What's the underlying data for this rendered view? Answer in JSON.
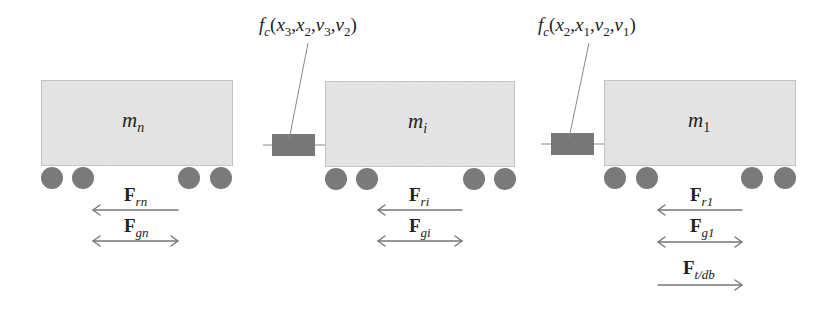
{
  "diagram": {
    "colors": {
      "car_fill": "#e2e2e2",
      "car_stroke": "#a8a8a8",
      "wheel_fill": "#7a7a7a",
      "coupler_fill": "#777777",
      "arrow_color": "#777777",
      "text_color": "#222222"
    },
    "cars": [
      {
        "id": "car-n",
        "mass_symbol": "m",
        "mass_sub": "n"
      },
      {
        "id": "car-i",
        "mass_symbol": "m",
        "mass_sub": "i"
      },
      {
        "id": "car-1",
        "mass_symbol": "m",
        "mass_sub": "1"
      }
    ],
    "couplers": [
      {
        "id": "coupler-3-2",
        "label_fn": "f",
        "label_fn_sub": "c",
        "args": "(x",
        "a1": "3",
        "a2": "2",
        "v1": "3",
        "v2": "2",
        "text": "f_c(x_3,x_2,v_3,v_2)"
      },
      {
        "id": "coupler-2-1",
        "label_fn": "f",
        "label_fn_sub": "c",
        "a1": "2",
        "a2": "1",
        "v1": "2",
        "v2": "1",
        "text": "f_c(x_2,x_1,v_2,v_1)"
      }
    ],
    "forces": {
      "car_n": [
        {
          "symbol": "F",
          "sub": "rn",
          "direction": "left"
        },
        {
          "symbol": "F",
          "sub": "gn",
          "direction": "both"
        }
      ],
      "car_i": [
        {
          "symbol": "F",
          "sub": "ri",
          "direction": "left"
        },
        {
          "symbol": "F",
          "sub": "gi",
          "direction": "both"
        }
      ],
      "car_1": [
        {
          "symbol": "F",
          "sub": "r1",
          "direction": "left"
        },
        {
          "symbol": "F",
          "sub": "g1",
          "direction": "both"
        },
        {
          "symbol": "F",
          "sub": "t/db",
          "direction": "right"
        }
      ]
    }
  }
}
